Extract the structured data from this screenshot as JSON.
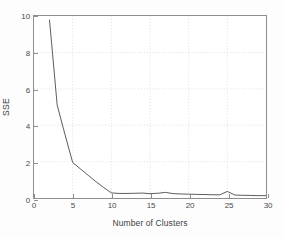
{
  "chart_data": {
    "type": "line",
    "title": "",
    "xlabel": "Number of Clusters",
    "ylabel": "SSE",
    "xlim": [
      0,
      30
    ],
    "ylim": [
      0,
      10
    ],
    "xticks": [
      0,
      5,
      10,
      15,
      20,
      25,
      30
    ],
    "yticks": [
      0,
      2,
      4,
      6,
      8,
      10
    ],
    "xtick_labels": [
      "0",
      "5",
      "10",
      "15",
      "20",
      "25",
      "30"
    ],
    "ytick_labels": [
      "0",
      "2",
      "4",
      "6",
      "8",
      "10"
    ],
    "grid": true,
    "grid_style": "dotted",
    "grid_color": "#d6d6d6",
    "legend": "none",
    "series": [
      {
        "name": "SSE",
        "color": "#4a4a4a",
        "line_width": 0.9,
        "x": [
          2,
          3,
          4,
          5,
          6,
          7,
          8,
          9,
          10,
          11,
          12,
          13,
          14,
          15,
          16,
          17,
          18,
          19,
          20,
          21,
          22,
          23,
          24,
          25,
          26,
          27,
          28,
          29,
          30
        ],
        "values": [
          9.8,
          5.1,
          3.5,
          1.95,
          1.6,
          1.25,
          0.9,
          0.58,
          0.28,
          0.25,
          0.25,
          0.26,
          0.27,
          0.24,
          0.26,
          0.31,
          0.24,
          0.22,
          0.21,
          0.2,
          0.19,
          0.18,
          0.17,
          0.36,
          0.16,
          0.15,
          0.14,
          0.13,
          0.13
        ]
      }
    ],
    "annotations": {
      "elbow_k": 10,
      "description": "SSE elbow curve decreasing sharply from k=2 to k=10 then flattening near zero"
    }
  },
  "axes": {
    "frame_color": "#8e8e8e",
    "tick_color": "#4a4a4a",
    "background": "#ffffff"
  },
  "figure": {
    "background": "#fdfdfd"
  }
}
